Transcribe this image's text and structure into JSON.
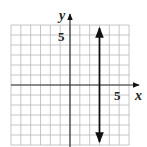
{
  "chart_data": {
    "type": "line",
    "title": "",
    "xlabel": "x",
    "ylabel": "y",
    "xlim": [
      -6,
      6
    ],
    "ylim": [
      -6,
      6
    ],
    "grid": true,
    "grid_step": 1,
    "tick_labels": {
      "x": [
        "5"
      ],
      "y": [
        "5"
      ]
    },
    "series": [
      {
        "name": "x = 3",
        "kind": "vertical-line",
        "x": [
          3,
          3
        ],
        "y": [
          -5.7,
          5.7
        ],
        "arrows": "both",
        "color": "#111111"
      }
    ]
  },
  "labels": {
    "x_axis": "x",
    "y_axis": "y",
    "x_tick": "5",
    "y_tick": "5"
  },
  "colors": {
    "grid": "#b8b8b8",
    "axis": "#333333",
    "line": "#111111"
  }
}
